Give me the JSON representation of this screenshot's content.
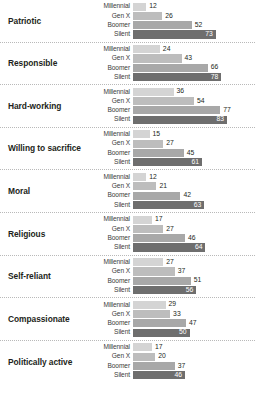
{
  "chart_data": {
    "type": "bar",
    "orientation": "horizontal",
    "title": "",
    "subtitle": "",
    "xlabel": "",
    "ylabel": "",
    "xlim": [
      0,
      100
    ],
    "grid": false,
    "legend_position": "none",
    "series_labels": [
      "Millennial",
      "Gen X",
      "Boomer",
      "Silent"
    ],
    "categories": [
      "Patriotic",
      "Responsible",
      "Hard-working",
      "Willing to sacrifice",
      "Moral",
      "Religious",
      "Self-reliant",
      "Compassionate",
      "Politically active"
    ],
    "series": [
      {
        "name": "Millennial",
        "values": [
          12,
          24,
          36,
          15,
          12,
          17,
          27,
          29,
          17
        ]
      },
      {
        "name": "Gen X",
        "values": [
          26,
          43,
          54,
          27,
          21,
          27,
          37,
          33,
          20
        ]
      },
      {
        "name": "Boomer",
        "values": [
          52,
          66,
          77,
          45,
          42,
          46,
          51,
          47,
          37
        ]
      },
      {
        "name": "Silent",
        "values": [
          73,
          78,
          83,
          61,
          63,
          64,
          56,
          50,
          46
        ]
      }
    ],
    "colors": {
      "millennial": "#d4d4d4",
      "genx": "#bdbdbd",
      "boomer": "#a8a8a8",
      "silent": "#6e6e6e",
      "text": "#231f20",
      "inline_text": "#ffffff",
      "separator": "#b9b9b9",
      "background": "#ffffff"
    }
  },
  "groups": [
    {
      "category": "Patriotic",
      "rows": [
        {
          "label": "Millennial",
          "value": "12",
          "n": 12,
          "inside": false
        },
        {
          "label": "Gen X",
          "value": "26",
          "n": 26,
          "inside": false
        },
        {
          "label": "Boomer",
          "value": "52",
          "n": 52,
          "inside": false
        },
        {
          "label": "Silent",
          "value": "73",
          "n": 73,
          "inside": true
        }
      ]
    },
    {
      "category": "Responsible",
      "rows": [
        {
          "label": "Millennial",
          "value": "24",
          "n": 24,
          "inside": false
        },
        {
          "label": "Gen X",
          "value": "43",
          "n": 43,
          "inside": false
        },
        {
          "label": "Boomer",
          "value": "66",
          "n": 66,
          "inside": false
        },
        {
          "label": "Silent",
          "value": "78",
          "n": 78,
          "inside": true
        }
      ]
    },
    {
      "category": "Hard-working",
      "rows": [
        {
          "label": "Millennial",
          "value": "36",
          "n": 36,
          "inside": false
        },
        {
          "label": "Gen X",
          "value": "54",
          "n": 54,
          "inside": false
        },
        {
          "label": "Boomer",
          "value": "77",
          "n": 77,
          "inside": false
        },
        {
          "label": "Silent",
          "value": "83",
          "n": 83,
          "inside": true
        }
      ]
    },
    {
      "category": "Willing to sacrifice",
      "rows": [
        {
          "label": "Millennial",
          "value": "15",
          "n": 15,
          "inside": false
        },
        {
          "label": "Gen X",
          "value": "27",
          "n": 27,
          "inside": false
        },
        {
          "label": "Boomer",
          "value": "45",
          "n": 45,
          "inside": false
        },
        {
          "label": "Silent",
          "value": "61",
          "n": 61,
          "inside": true
        }
      ]
    },
    {
      "category": "Moral",
      "rows": [
        {
          "label": "Millennial",
          "value": "12",
          "n": 12,
          "inside": false
        },
        {
          "label": "Gen X",
          "value": "21",
          "n": 21,
          "inside": false
        },
        {
          "label": "Boomer",
          "value": "42",
          "n": 42,
          "inside": false
        },
        {
          "label": "Silent",
          "value": "63",
          "n": 63,
          "inside": true
        }
      ]
    },
    {
      "category": "Religious",
      "rows": [
        {
          "label": "Millennial",
          "value": "17",
          "n": 17,
          "inside": false
        },
        {
          "label": "Gen X",
          "value": "27",
          "n": 27,
          "inside": false
        },
        {
          "label": "Boomer",
          "value": "46",
          "n": 46,
          "inside": false
        },
        {
          "label": "Silent",
          "value": "64",
          "n": 64,
          "inside": true
        }
      ]
    },
    {
      "category": "Self-reliant",
      "rows": [
        {
          "label": "Millennial",
          "value": "27",
          "n": 27,
          "inside": false
        },
        {
          "label": "Gen X",
          "value": "37",
          "n": 37,
          "inside": false
        },
        {
          "label": "Boomer",
          "value": "51",
          "n": 51,
          "inside": false
        },
        {
          "label": "Silent",
          "value": "56",
          "n": 56,
          "inside": true
        }
      ]
    },
    {
      "category": "Compassionate",
      "rows": [
        {
          "label": "Millennial",
          "value": "29",
          "n": 29,
          "inside": false
        },
        {
          "label": "Gen X",
          "value": "33",
          "n": 33,
          "inside": false
        },
        {
          "label": "Boomer",
          "value": "47",
          "n": 47,
          "inside": false
        },
        {
          "label": "Silent",
          "value": "50",
          "n": 50,
          "inside": true
        }
      ]
    },
    {
      "category": "Politically active",
      "rows": [
        {
          "label": "Millennial",
          "value": "17",
          "n": 17,
          "inside": false
        },
        {
          "label": "Gen X",
          "value": "20",
          "n": 20,
          "inside": false
        },
        {
          "label": "Boomer",
          "value": "37",
          "n": 37,
          "inside": false
        },
        {
          "label": "Silent",
          "value": "46",
          "n": 46,
          "inside": true
        }
      ]
    }
  ]
}
